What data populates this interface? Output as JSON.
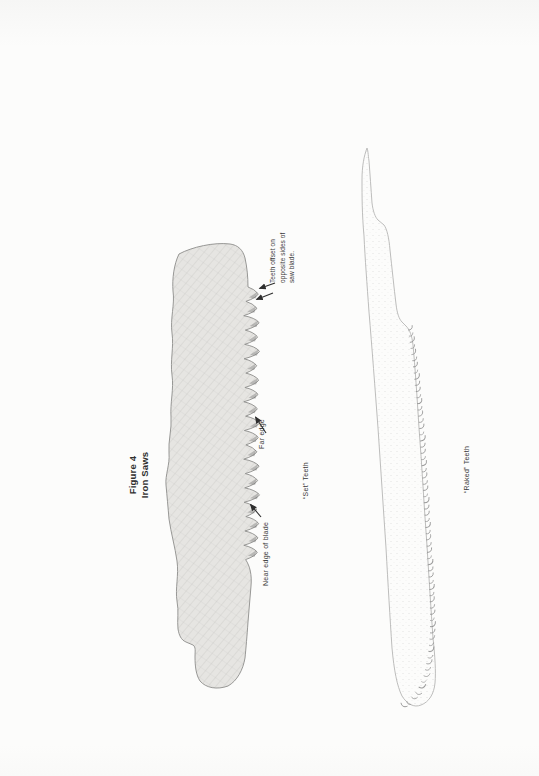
{
  "figure": {
    "label": "Figure 4",
    "title": "Iron Saws"
  },
  "set_saw": {
    "near_edge_label": "Near edge of blade",
    "far_edge_label": "Far edge",
    "teeth_label": "“Set” Teeth",
    "offset_note_lines": [
      "Teeth offset on",
      "opposite sides of",
      "saw blade."
    ]
  },
  "raked_saw": {
    "teeth_label": "“Raked” Teeth"
  },
  "colors": {
    "ink": "#3a3a3a",
    "arrow": "#2e2e2e",
    "pencil_fill": "#e6e5e2",
    "set_saw_outline": "#8d8d8b",
    "raked_saw_outline": "#b6b6b4",
    "paper": "#fcfcfb"
  }
}
